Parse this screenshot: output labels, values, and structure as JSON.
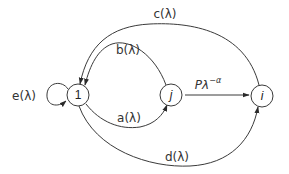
{
  "diagram": {
    "type": "state-transition-graph",
    "colors": {
      "stroke": "#3a3a3a",
      "text": "#333333",
      "background": "#ffffff"
    },
    "nodes": [
      {
        "id": "1",
        "label": "1",
        "italic": false
      },
      {
        "id": "j",
        "label": "j",
        "italic": true
      },
      {
        "id": "i",
        "label": "i",
        "italic": true
      }
    ],
    "edges": [
      {
        "id": "c",
        "from": "i",
        "to": "1",
        "label": "c(λ)"
      },
      {
        "id": "b",
        "from": "j",
        "to": "1",
        "label": "b(λ)"
      },
      {
        "id": "a",
        "from": "1",
        "to": "j",
        "label": "a(λ)"
      },
      {
        "id": "d",
        "from": "1",
        "to": "i",
        "label": "d(λ)"
      },
      {
        "id": "e",
        "from": "1",
        "to": "1",
        "label": "e(λ)"
      },
      {
        "id": "p",
        "from": "j",
        "to": "i",
        "label_base": "Pλ",
        "label_sup": "−α"
      }
    ]
  }
}
